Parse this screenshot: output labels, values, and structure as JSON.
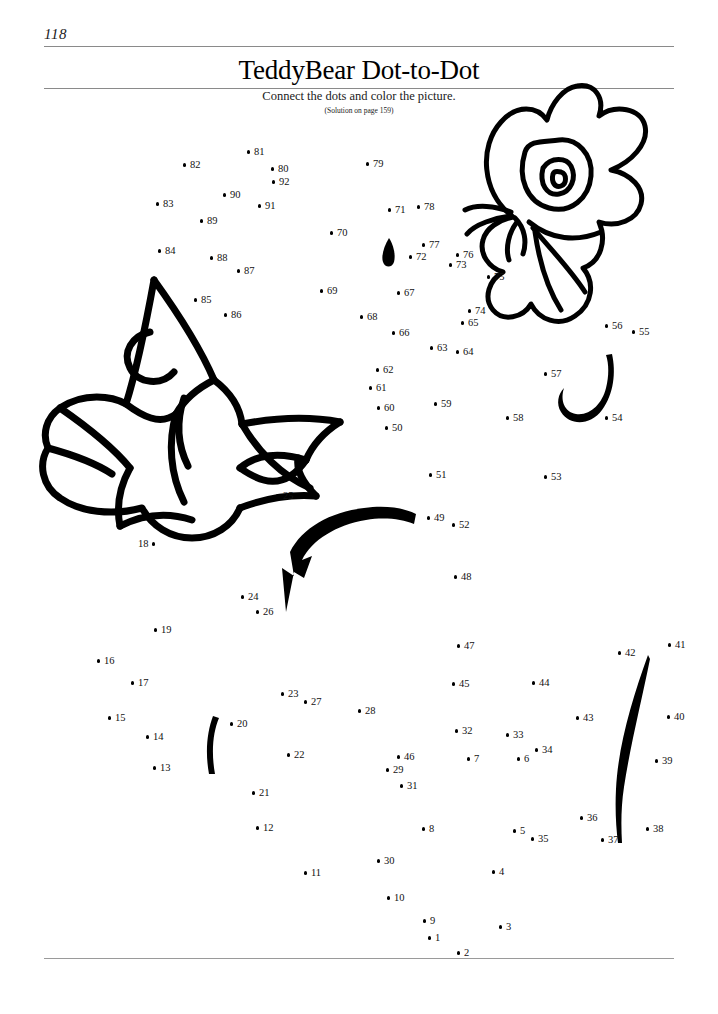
{
  "page": {
    "number": "118",
    "title": "TeddyBear Dot-to-Dot",
    "subtitle": "Connect the dots and color the picture.",
    "solution_note": "(Solution on page 159)",
    "background_color": "#ffffff",
    "ink_color": "#000000",
    "rule_color": "#8a8a8a"
  },
  "puzzle": {
    "type": "dot-to-dot",
    "dot_count": 92,
    "dots": [
      {
        "n": "1",
        "x": 430,
        "y": 938,
        "side": "right"
      },
      {
        "n": "2",
        "x": 459,
        "y": 953,
        "side": "right"
      },
      {
        "n": "3",
        "x": 501,
        "y": 927,
        "side": "right"
      },
      {
        "n": "4",
        "x": 494,
        "y": 872,
        "side": "right"
      },
      {
        "n": "5",
        "x": 515,
        "y": 831,
        "side": "right"
      },
      {
        "n": "6",
        "x": 519,
        "y": 759,
        "side": "right"
      },
      {
        "n": "7",
        "x": 469,
        "y": 759,
        "side": "right"
      },
      {
        "n": "8",
        "x": 424,
        "y": 829,
        "side": "right"
      },
      {
        "n": "9",
        "x": 425,
        "y": 921,
        "side": "right"
      },
      {
        "n": "10",
        "x": 389,
        "y": 898,
        "side": "right"
      },
      {
        "n": "11",
        "x": 306,
        "y": 873,
        "side": "right"
      },
      {
        "n": "12",
        "x": 258,
        "y": 828,
        "side": "right"
      },
      {
        "n": "13",
        "x": 155,
        "y": 768,
        "side": "right"
      },
      {
        "n": "14",
        "x": 148,
        "y": 737,
        "side": "right"
      },
      {
        "n": "15",
        "x": 110,
        "y": 718,
        "side": "right"
      },
      {
        "n": "16",
        "x": 99,
        "y": 661,
        "side": "right"
      },
      {
        "n": "17",
        "x": 133,
        "y": 683,
        "side": "right"
      },
      {
        "n": "18",
        "x": 156,
        "y": 544,
        "side": "left"
      },
      {
        "n": "19",
        "x": 156,
        "y": 630,
        "side": "right"
      },
      {
        "n": "20",
        "x": 232,
        "y": 724,
        "side": "right"
      },
      {
        "n": "21",
        "x": 254,
        "y": 793,
        "side": "right"
      },
      {
        "n": "22",
        "x": 289,
        "y": 755,
        "side": "right"
      },
      {
        "n": "23",
        "x": 283,
        "y": 694,
        "side": "right"
      },
      {
        "n": "24",
        "x": 243,
        "y": 597,
        "side": "right"
      },
      {
        "n": "25",
        "x": 278,
        "y": 496,
        "side": "right"
      },
      {
        "n": "26",
        "x": 258,
        "y": 612,
        "side": "right"
      },
      {
        "n": "27",
        "x": 306,
        "y": 702,
        "side": "right"
      },
      {
        "n": "28",
        "x": 360,
        "y": 711,
        "side": "right"
      },
      {
        "n": "29",
        "x": 388,
        "y": 770,
        "side": "right"
      },
      {
        "n": "30",
        "x": 379,
        "y": 861,
        "side": "right"
      },
      {
        "n": "31",
        "x": 402,
        "y": 786,
        "side": "right"
      },
      {
        "n": "32",
        "x": 457,
        "y": 731,
        "side": "right"
      },
      {
        "n": "33",
        "x": 508,
        "y": 735,
        "side": "right"
      },
      {
        "n": "34",
        "x": 537,
        "y": 750,
        "side": "right"
      },
      {
        "n": "35",
        "x": 533,
        "y": 839,
        "side": "right"
      },
      {
        "n": "36",
        "x": 582,
        "y": 818,
        "side": "right"
      },
      {
        "n": "37",
        "x": 603,
        "y": 840,
        "side": "right"
      },
      {
        "n": "38",
        "x": 648,
        "y": 829,
        "side": "right"
      },
      {
        "n": "39",
        "x": 657,
        "y": 761,
        "side": "right"
      },
      {
        "n": "40",
        "x": 669,
        "y": 717,
        "side": "right"
      },
      {
        "n": "41",
        "x": 670,
        "y": 645,
        "side": "right"
      },
      {
        "n": "42",
        "x": 620,
        "y": 653,
        "side": "right"
      },
      {
        "n": "43",
        "x": 578,
        "y": 718,
        "side": "right"
      },
      {
        "n": "44",
        "x": 534,
        "y": 683,
        "side": "right"
      },
      {
        "n": "45",
        "x": 454,
        "y": 684,
        "side": "right"
      },
      {
        "n": "46",
        "x": 399,
        "y": 757,
        "side": "right"
      },
      {
        "n": "47",
        "x": 459,
        "y": 646,
        "side": "right"
      },
      {
        "n": "48",
        "x": 456,
        "y": 577,
        "side": "right"
      },
      {
        "n": "49",
        "x": 429,
        "y": 518,
        "side": "right"
      },
      {
        "n": "50",
        "x": 387,
        "y": 428,
        "side": "right"
      },
      {
        "n": "51",
        "x": 431,
        "y": 475,
        "side": "right"
      },
      {
        "n": "52",
        "x": 454,
        "y": 525,
        "side": "right"
      },
      {
        "n": "53",
        "x": 546,
        "y": 477,
        "side": "right"
      },
      {
        "n": "54",
        "x": 607,
        "y": 418,
        "side": "right"
      },
      {
        "n": "55",
        "x": 634,
        "y": 332,
        "side": "right"
      },
      {
        "n": "56",
        "x": 607,
        "y": 326,
        "side": "right"
      },
      {
        "n": "57",
        "x": 546,
        "y": 374,
        "side": "right"
      },
      {
        "n": "58",
        "x": 508,
        "y": 418,
        "side": "right"
      },
      {
        "n": "59",
        "x": 436,
        "y": 404,
        "side": "right"
      },
      {
        "n": "60",
        "x": 379,
        "y": 408,
        "side": "right"
      },
      {
        "n": "61",
        "x": 371,
        "y": 388,
        "side": "right"
      },
      {
        "n": "62",
        "x": 378,
        "y": 370,
        "side": "right"
      },
      {
        "n": "63",
        "x": 432,
        "y": 348,
        "side": "right"
      },
      {
        "n": "64",
        "x": 458,
        "y": 352,
        "side": "right"
      },
      {
        "n": "65",
        "x": 463,
        "y": 323,
        "side": "right"
      },
      {
        "n": "66",
        "x": 394,
        "y": 333,
        "side": "right"
      },
      {
        "n": "67",
        "x": 399,
        "y": 293,
        "side": "right"
      },
      {
        "n": "68",
        "x": 362,
        "y": 317,
        "side": "right"
      },
      {
        "n": "69",
        "x": 322,
        "y": 291,
        "side": "right"
      },
      {
        "n": "70",
        "x": 332,
        "y": 233,
        "side": "right"
      },
      {
        "n": "71",
        "x": 390,
        "y": 210,
        "side": "right"
      },
      {
        "n": "72",
        "x": 411,
        "y": 257,
        "side": "right"
      },
      {
        "n": "73",
        "x": 451,
        "y": 265,
        "side": "right"
      },
      {
        "n": "74",
        "x": 470,
        "y": 311,
        "side": "right"
      },
      {
        "n": "75",
        "x": 489,
        "y": 277,
        "side": "right"
      },
      {
        "n": "76",
        "x": 458,
        "y": 255,
        "side": "right"
      },
      {
        "n": "77",
        "x": 424,
        "y": 245,
        "side": "right"
      },
      {
        "n": "78",
        "x": 419,
        "y": 207,
        "side": "right"
      },
      {
        "n": "79",
        "x": 368,
        "y": 164,
        "side": "right"
      },
      {
        "n": "80",
        "x": 273,
        "y": 169,
        "side": "right"
      },
      {
        "n": "81",
        "x": 249,
        "y": 152,
        "side": "right"
      },
      {
        "n": "82",
        "x": 185,
        "y": 165,
        "side": "right"
      },
      {
        "n": "83",
        "x": 158,
        "y": 204,
        "side": "right"
      },
      {
        "n": "84",
        "x": 160,
        "y": 251,
        "side": "right"
      },
      {
        "n": "85",
        "x": 196,
        "y": 300,
        "side": "right"
      },
      {
        "n": "86",
        "x": 226,
        "y": 315,
        "side": "right"
      },
      {
        "n": "87",
        "x": 239,
        "y": 271,
        "side": "right"
      },
      {
        "n": "88",
        "x": 212,
        "y": 258,
        "side": "right"
      },
      {
        "n": "89",
        "x": 202,
        "y": 221,
        "side": "right"
      },
      {
        "n": "90",
        "x": 225,
        "y": 195,
        "side": "right"
      },
      {
        "n": "91",
        "x": 260,
        "y": 206,
        "side": "right"
      },
      {
        "n": "92",
        "x": 274,
        "y": 182,
        "side": "right"
      }
    ]
  },
  "artwork": {
    "butterfly": "butterfly-illustration",
    "bow": "bow-ribbon-illustration",
    "swoosh": "curved-stroke-illustration",
    "hook": "hook-stroke-illustration",
    "stroke_left": "short-curved-stroke",
    "stroke_right": "long-curved-stroke",
    "teardrop": "teardrop-mark"
  }
}
